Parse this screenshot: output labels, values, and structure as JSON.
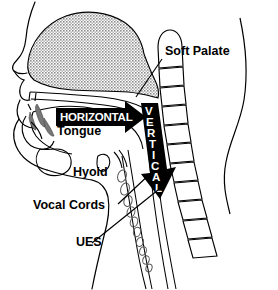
{
  "figure": {
    "kind": "anatomical-line-diagram",
    "title_visible": false,
    "view": "mid-sagittal section of head and neck",
    "background_color": "#ffffff",
    "ink_color": "#000000",
    "shading_color": "#9a9a9a"
  },
  "labels": {
    "soft_palate": "Soft Palate",
    "tongue": "Tongue",
    "hyoid": "Hyoid",
    "vocal_cords": "Vocal Cords",
    "ues": "UES"
  },
  "arrows": {
    "horizontal": {
      "text": "HORIZONTAL",
      "direction": "right",
      "fill": "#000000",
      "text_color": "#ffffff"
    },
    "vertical": {
      "text": "VERTICAL",
      "letters": [
        "V",
        "E",
        "R",
        "T",
        "I",
        "C",
        "A",
        "L"
      ],
      "direction": "down",
      "fill": "#000000",
      "text_color": "#ffffff"
    }
  },
  "structures": {
    "nasal_cavity": "stippled gray region",
    "vertebral_column": "stacked cervical vertebrae",
    "trachea_rings": "row of small oval cartilage rings",
    "neck_contour": "posterior neck profile line"
  }
}
